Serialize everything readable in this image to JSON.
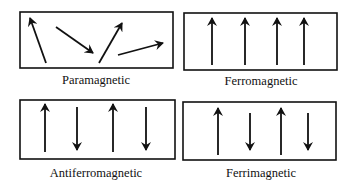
{
  "figure": {
    "colors": {
      "ink": "#111111",
      "background": "#ffffff"
    },
    "panels": [
      {
        "id": "paramagnetic",
        "label": "Paramagnetic",
        "box": {
          "x": 20,
          "y": 12,
          "w": 153,
          "h": 56
        },
        "label_pos": {
          "x": 96,
          "y": 84
        },
        "arrows": [
          {
            "x1": 46,
            "y1": 63,
            "x2": 30,
            "y2": 18,
            "direction": "up-left"
          },
          {
            "x1": 56,
            "y1": 27,
            "x2": 93,
            "y2": 53,
            "direction": "down-right"
          },
          {
            "x1": 99,
            "y1": 63,
            "x2": 122,
            "y2": 23,
            "direction": "up-right"
          },
          {
            "x1": 118,
            "y1": 55,
            "x2": 163,
            "y2": 43,
            "direction": "right"
          }
        ]
      },
      {
        "id": "ferromagnetic",
        "label": "Ferromagnetic",
        "box": {
          "x": 184,
          "y": 13,
          "w": 153,
          "h": 57
        },
        "label_pos": {
          "x": 261,
          "y": 85
        },
        "arrows": [
          {
            "x1": 212,
            "y1": 65,
            "x2": 212,
            "y2": 18,
            "direction": "up"
          },
          {
            "x1": 245,
            "y1": 65,
            "x2": 245,
            "y2": 18,
            "direction": "up"
          },
          {
            "x1": 277,
            "y1": 65,
            "x2": 277,
            "y2": 18,
            "direction": "up"
          },
          {
            "x1": 304,
            "y1": 65,
            "x2": 304,
            "y2": 18,
            "direction": "up"
          }
        ]
      },
      {
        "id": "antiferromagnetic",
        "label": "Antiferromagnetic",
        "box": {
          "x": 20,
          "y": 100,
          "w": 155,
          "h": 59
        },
        "label_pos": {
          "x": 96,
          "y": 177
        },
        "arrows": [
          {
            "x1": 45,
            "y1": 152,
            "x2": 45,
            "y2": 104,
            "direction": "up"
          },
          {
            "x1": 77,
            "y1": 107,
            "x2": 77,
            "y2": 150,
            "direction": "down"
          },
          {
            "x1": 113,
            "y1": 152,
            "x2": 113,
            "y2": 104,
            "direction": "up"
          },
          {
            "x1": 146,
            "y1": 107,
            "x2": 146,
            "y2": 150,
            "direction": "down"
          }
        ]
      },
      {
        "id": "ferrimagnetic",
        "label": "Ferrimagnetic",
        "box": {
          "x": 183,
          "y": 102,
          "w": 153,
          "h": 58
        },
        "label_pos": {
          "x": 261,
          "y": 177
        },
        "arrows": [
          {
            "x1": 218,
            "y1": 155,
            "x2": 218,
            "y2": 108,
            "direction": "up"
          },
          {
            "x1": 250,
            "y1": 113,
            "x2": 250,
            "y2": 150,
            "direction": "down"
          },
          {
            "x1": 281,
            "y1": 155,
            "x2": 281,
            "y2": 108,
            "direction": "up"
          },
          {
            "x1": 308,
            "y1": 113,
            "x2": 308,
            "y2": 150,
            "direction": "down"
          }
        ]
      }
    ]
  }
}
